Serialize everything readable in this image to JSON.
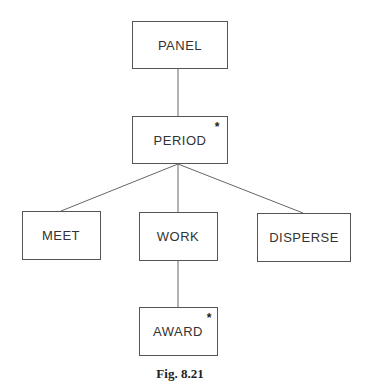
{
  "diagram": {
    "type": "tree",
    "nodes": [
      {
        "id": "panel",
        "label": "PANEL",
        "iterated": false
      },
      {
        "id": "period",
        "label": "PERIOD",
        "iterated": true
      },
      {
        "id": "meet",
        "label": "MEET",
        "iterated": false
      },
      {
        "id": "work",
        "label": "WORK",
        "iterated": false
      },
      {
        "id": "disperse",
        "label": "DISPERSE",
        "iterated": false
      },
      {
        "id": "award",
        "label": "AWARD",
        "iterated": true
      }
    ],
    "edges": [
      {
        "from": "panel",
        "to": "period"
      },
      {
        "from": "period",
        "to": "meet"
      },
      {
        "from": "period",
        "to": "work"
      },
      {
        "from": "period",
        "to": "disperse"
      },
      {
        "from": "work",
        "to": "award"
      }
    ],
    "iteration_marker": "*",
    "caption": "Fig. 8.21"
  }
}
